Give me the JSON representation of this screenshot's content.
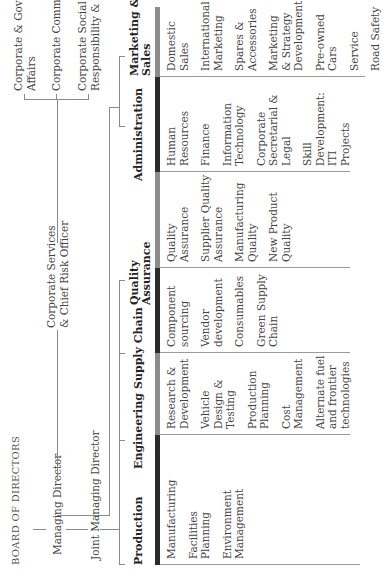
{
  "title": "BOARD OF DIRECTORS",
  "executives": {
    "managing_director": "Managing Director",
    "joint_managing_director": "Joint Managing Director",
    "corporate_services": [
      "Corporate Services",
      "& Chief Risk Officer"
    ]
  },
  "corporate_functions": [
    {
      "lines": [
        "Corporate & Government",
        "Affairs"
      ]
    },
    {
      "lines": [
        "Corporate Communications"
      ]
    },
    {
      "lines": [
        "Corporate Social",
        "Responsibility & Sustainability"
      ]
    }
  ],
  "departments": [
    {
      "name": [
        "Production"
      ],
      "bar_color": "#2b2b2b",
      "items": [
        [
          "Manufacturing"
        ],
        [
          "Facilities",
          "Planning"
        ],
        [
          "Environment",
          "Management"
        ]
      ]
    },
    {
      "name": [
        "Engineering"
      ],
      "bar_color": "#8c8c8c",
      "items": [
        [
          "Research &",
          "Development"
        ],
        [
          "Vehicle Design &",
          "Testing"
        ],
        [
          "Production",
          "Planning"
        ],
        [
          "Cost",
          "Management"
        ],
        [
          "Alternate fuel",
          "and frontier",
          "technologies"
        ]
      ]
    },
    {
      "name": [
        "Supply Chain"
      ],
      "bar_color": "#2b2b2b",
      "items": [
        [
          "Component",
          "sourcing"
        ],
        [
          "Vendor",
          "development"
        ],
        [
          "Consumables"
        ],
        [
          "Green Supply",
          "Chain"
        ]
      ]
    },
    {
      "name": [
        "Quality",
        "Assurance"
      ],
      "bar_color": "#8c8c8c",
      "items": [
        [
          "Quality",
          "Assurance"
        ],
        [
          "Supplier Quality",
          "Assurance"
        ],
        [
          "Manufacturing",
          "Quality"
        ],
        [
          "New Product",
          "Quality"
        ]
      ]
    },
    {
      "name": [
        "Administration"
      ],
      "bar_color": "#2b2b2b",
      "items": [
        [
          "Human",
          "Resources"
        ],
        [
          "Finance"
        ],
        [
          "Information",
          "Technology"
        ],
        [
          "Corporate",
          "Secretarial &",
          "Legal"
        ],
        [
          "Skill",
          "Development: ITI",
          "Projects"
        ]
      ]
    },
    {
      "name": [
        "Marketing &",
        "Sales"
      ],
      "bar_color": "#8c8c8c",
      "items": [
        [
          "Domestic Sales"
        ],
        [
          "International",
          "Marketing"
        ],
        [
          "Spares &",
          "Accessories"
        ],
        [
          "Marketing",
          "& Strategy",
          "Development"
        ],
        [
          "Pre-owned Cars"
        ],
        [
          "Service"
        ],
        [
          "Road Safety"
        ]
      ]
    }
  ],
  "colors": {
    "dark_bar": "#2b2b2b",
    "light_bar": "#8c8c8c",
    "line": "#8a8a8a"
  }
}
